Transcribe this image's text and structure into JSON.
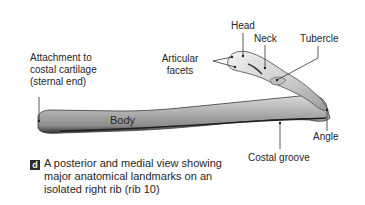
{
  "figure": {
    "panel_letter": "d",
    "caption": "A posterior and medial view showing major anatomical landmarks on an isolated right rib (rib 10)",
    "caption_lines": [
      "A posterior and medial view showing",
      "major anatomical landmarks on an",
      "isolated right rib (rib 10)"
    ]
  },
  "labels": {
    "attachment": [
      "Attachment to",
      "costal cartilage",
      "(sternal end)"
    ],
    "articular_facets": [
      "Articular",
      "facets"
    ],
    "head": "Head",
    "neck": "Neck",
    "tubercle": "Tubercle",
    "body": "Body",
    "angle": "Angle",
    "costal_groove": "Costal groove"
  },
  "colors": {
    "bone_light": "#e8e8e8",
    "bone_mid": "#b8b8b8",
    "bone_dark": "#5a5a5a",
    "leader": "#333333",
    "badge": "#2b2b2b"
  }
}
